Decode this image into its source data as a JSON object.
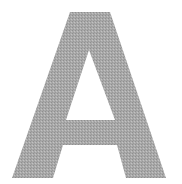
{
  "glyph": {
    "character": "A",
    "fill_color": "#a9a9a9",
    "texture_dark": "#8f8f8f",
    "texture_light": "#c2c2c2",
    "background_color": "#ffffff"
  }
}
